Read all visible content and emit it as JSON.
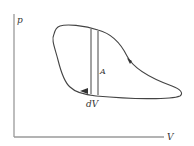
{
  "diagram": {
    "type": "pV-diagram",
    "axes": {
      "y_label": "p",
      "x_label": "V"
    },
    "labels": {
      "area": "A",
      "strip_width": "dV"
    },
    "colors": {
      "axis": "#9a9a9a",
      "curve": "#444444",
      "text": "#333333",
      "background": "#ffffff"
    },
    "cycle_direction": "clockwise"
  }
}
